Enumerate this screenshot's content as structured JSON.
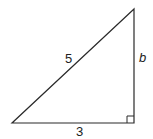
{
  "diagram": {
    "type": "right-triangle",
    "stroke_color": "#2a2a2a",
    "vertices": {
      "top": [
        134,
        9
      ],
      "bottom_left": [
        12,
        123
      ],
      "right_angle": [
        134,
        123
      ]
    },
    "labels": {
      "hypotenuse": "5",
      "base": "3",
      "height": "b"
    },
    "right_angle_marker": true
  }
}
